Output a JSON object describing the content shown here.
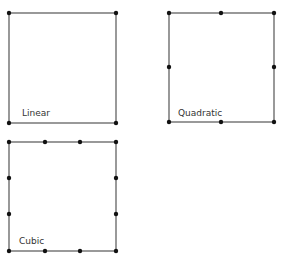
{
  "diagram": {
    "elements": [
      {
        "label": "Linear",
        "rect": {
          "x1": 9,
          "y1": 13,
          "x2": 116,
          "y2": 123
        },
        "label_pos": {
          "x": 22,
          "y": 116
        },
        "nodes": [
          [
            9,
            13
          ],
          [
            116,
            13
          ],
          [
            9,
            123
          ],
          [
            116,
            123
          ]
        ]
      },
      {
        "label": "Quadratic",
        "rect": {
          "x1": 169,
          "y1": 13,
          "x2": 274,
          "y2": 122
        },
        "label_pos": {
          "x": 178,
          "y": 116
        },
        "nodes": [
          [
            169,
            13
          ],
          [
            221,
            13
          ],
          [
            274,
            13
          ],
          [
            169,
            67
          ],
          [
            274,
            67
          ],
          [
            169,
            122
          ],
          [
            221,
            122
          ],
          [
            274,
            122
          ]
        ]
      },
      {
        "label": "Cubic",
        "rect": {
          "x1": 9,
          "y1": 142,
          "x2": 116,
          "y2": 251
        },
        "label_pos": {
          "x": 19,
          "y": 244
        },
        "nodes": [
          [
            9,
            142
          ],
          [
            45,
            142
          ],
          [
            80,
            142
          ],
          [
            116,
            142
          ],
          [
            9,
            178
          ],
          [
            116,
            178
          ],
          [
            9,
            214
          ],
          [
            116,
            214
          ],
          [
            9,
            251
          ],
          [
            45,
            251
          ],
          [
            80,
            251
          ],
          [
            116,
            251
          ]
        ]
      }
    ],
    "colors": {
      "line": "#555555",
      "node": "#111111",
      "label": "#333333"
    }
  }
}
